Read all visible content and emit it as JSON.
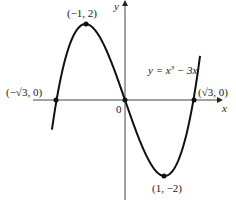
{
  "chart_data": {
    "type": "line",
    "title": "",
    "function_label": "y = x³ − 3x",
    "function_label_parts": {
      "lhs": "y = x",
      "exp": "3",
      "rhs": " − 3x"
    },
    "xlabel": "x",
    "ylabel": "y",
    "origin_label": "0",
    "xlim": [
      -2.3,
      2.3
    ],
    "ylim": [
      -2.6,
      2.6
    ],
    "grid": false,
    "series": [
      {
        "name": "y = x^3 - 3x",
        "x": [
          -1.85,
          -1.732,
          -1.5,
          -1,
          -0.5,
          0,
          0.5,
          1,
          1.5,
          1.732,
          1.9
        ],
        "y": [
          -0.78,
          0,
          1.125,
          2,
          1.375,
          0,
          -1.375,
          -2,
          -1.125,
          0,
          1.16
        ]
      }
    ],
    "annotations": [
      {
        "label": "(−1, 2)",
        "x": -1,
        "y": 2
      },
      {
        "label": "(1, −2)",
        "x": 1,
        "y": -2
      },
      {
        "label": "(−√3, 0)",
        "x": -1.732,
        "y": 0
      },
      {
        "label": "(√3, 0)",
        "x": 1.732,
        "y": 0
      },
      {
        "label": "0",
        "x": 0,
        "y": 0
      }
    ]
  }
}
